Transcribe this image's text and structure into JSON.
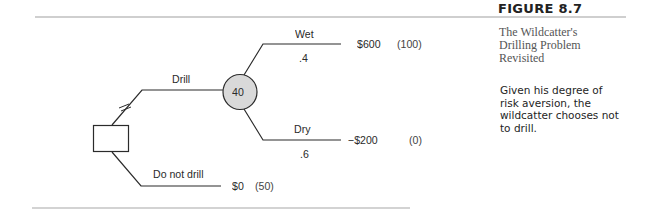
{
  "figure": {
    "number": "FIGURE 8.7",
    "caption_lines": [
      "The Wildcatter's",
      "Drilling Problem",
      "Revisited"
    ],
    "note_lines": [
      "Given his degree of",
      "risk aversion, the",
      "wildcatter chooses not",
      "to drill."
    ]
  },
  "tree": {
    "decision_node": {
      "shape": "square"
    },
    "chance_node": {
      "value": "40",
      "fill": "#d9d9d9"
    },
    "branches": {
      "drill": {
        "label": "Drill",
        "pruned": false
      },
      "do_not_drill": {
        "label": "Do not drill",
        "payoff": "$0",
        "utility": "(50)"
      },
      "wet": {
        "label": "Wet",
        "probability": ".4",
        "payoff": "$600",
        "utility": "(100)"
      },
      "dry": {
        "label": "Dry",
        "probability": ".6",
        "payoff": "−$200",
        "utility": "(0)"
      }
    },
    "pruned_marker": "//"
  },
  "colors": {
    "line": "#2b2b2b",
    "rule": "#9a9a9a",
    "chance_fill": "#d9d9d9"
  }
}
